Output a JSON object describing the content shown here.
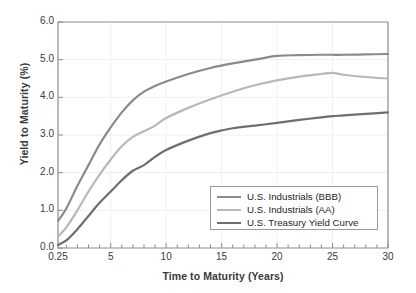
{
  "chart_data": {
    "type": "line",
    "title": "",
    "xlabel": "Time to Maturity (Years)",
    "ylabel": "Yield to Maturity (%)",
    "xlim": [
      0.25,
      30
    ],
    "ylim": [
      0.0,
      6.0
    ],
    "grid": true,
    "legend_position": "lower-right",
    "xticks": [
      "0.25",
      "5",
      "10",
      "15",
      "20",
      "25",
      "30"
    ],
    "xtick_values": [
      0.25,
      5,
      10,
      15,
      20,
      25,
      30
    ],
    "yticks": [
      "0.0",
      "1.0",
      "2.0",
      "3.0",
      "4.0",
      "5.0",
      "6.0"
    ],
    "ytick_values": [
      0.0,
      1.0,
      2.0,
      3.0,
      4.0,
      5.0,
      6.0
    ],
    "x": [
      0.25,
      1,
      2,
      3,
      4,
      5,
      6,
      7,
      8,
      9,
      10,
      12,
      14,
      16,
      18,
      20,
      22,
      24,
      25,
      26,
      28,
      30
    ],
    "series": [
      {
        "name": "U.S. Industrials (BBB)",
        "color": "#8a8a8a",
        "values": [
          0.72,
          1.05,
          1.65,
          2.2,
          2.75,
          3.2,
          3.6,
          3.92,
          4.15,
          4.3,
          4.42,
          4.62,
          4.78,
          4.9,
          5.0,
          5.1,
          5.12,
          5.13,
          5.13,
          5.13,
          5.14,
          5.15
        ]
      },
      {
        "name": "U.S. Industrials (AA)",
        "color": "#b8b8b8",
        "values": [
          0.3,
          0.55,
          1.0,
          1.5,
          1.95,
          2.35,
          2.7,
          2.95,
          3.1,
          3.25,
          3.45,
          3.72,
          3.95,
          4.15,
          4.32,
          4.45,
          4.55,
          4.62,
          4.65,
          4.6,
          4.54,
          4.5
        ]
      },
      {
        "name": "U.S. Treasury Yield Curve",
        "color": "#6e6e6e",
        "values": [
          0.08,
          0.2,
          0.5,
          0.85,
          1.2,
          1.5,
          1.8,
          2.05,
          2.2,
          2.42,
          2.6,
          2.85,
          3.05,
          3.18,
          3.25,
          3.32,
          3.4,
          3.47,
          3.5,
          3.52,
          3.56,
          3.6
        ]
      }
    ]
  },
  "axes": {
    "ylabel": "Yield to Maturity (%)",
    "xlabel": "Time to Maturity (Years)"
  },
  "legend": {
    "entries": [
      {
        "label": "U.S. Industrials (BBB)",
        "color": "#8a8a8a"
      },
      {
        "label": "U.S. Industrials (AA)",
        "color": "#b8b8b8"
      },
      {
        "label": "U.S. Treasury Yield Curve",
        "color": "#6e6e6e"
      }
    ]
  },
  "colors": {
    "bbb": "#8a8a8a",
    "aa": "#b8b8b8",
    "treasury": "#6e6e6e",
    "axis": "#8c8c8c",
    "grid": "#f0f0f0",
    "text": "#3a3a3a"
  }
}
